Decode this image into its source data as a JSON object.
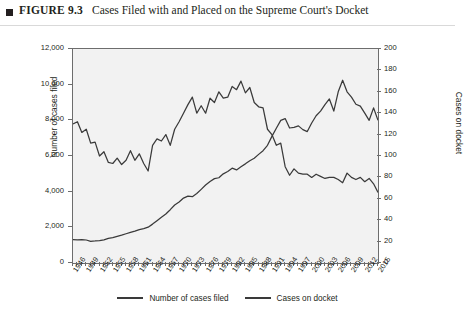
{
  "figure": {
    "label": "FIGURE 9.3",
    "caption": "Cases Filed with and Placed on the Supreme Court's Docket"
  },
  "chart_data": {
    "type": "line",
    "title": "Cases Filed with and Placed on the Supreme Court's Docket",
    "xlabel": "",
    "ylabel": "Number of cases filed",
    "y2label": "Cases on docket",
    "ylim": [
      0,
      12000
    ],
    "y2lim": [
      0,
      200
    ],
    "xlim": [
      1946,
      2015
    ],
    "grid": false,
    "legend_position": "bottom",
    "yticks": [
      "0",
      "2,000",
      "4,000",
      "6,000",
      "8,000",
      "10,000",
      "12,000"
    ],
    "ytick_values": [
      0,
      2000,
      4000,
      6000,
      8000,
      10000,
      12000
    ],
    "y2ticks": [
      "0",
      "20",
      "40",
      "60",
      "80",
      "100",
      "120",
      "140",
      "160",
      "180",
      "200"
    ],
    "y2tick_values": [
      0,
      20,
      40,
      60,
      80,
      100,
      120,
      140,
      160,
      180,
      200
    ],
    "xticks": [
      "1946",
      "1949",
      "1952",
      "1955",
      "1958",
      "1961",
      "1964",
      "1967",
      "1970",
      "1973",
      "1976",
      "1979",
      "1982",
      "1985",
      "1988",
      "1991",
      "1994",
      "1997",
      "2000",
      "2003",
      "2006",
      "2009",
      "2012",
      "2015"
    ],
    "x": [
      1946,
      1947,
      1948,
      1949,
      1950,
      1951,
      1952,
      1953,
      1954,
      1955,
      1956,
      1957,
      1958,
      1959,
      1960,
      1961,
      1962,
      1963,
      1964,
      1965,
      1966,
      1967,
      1968,
      1969,
      1970,
      1971,
      1972,
      1973,
      1974,
      1975,
      1976,
      1977,
      1978,
      1979,
      1980,
      1981,
      1982,
      1983,
      1984,
      1985,
      1986,
      1987,
      1988,
      1989,
      1990,
      1991,
      1992,
      1993,
      1994,
      1995,
      1996,
      1997,
      1998,
      1999,
      2000,
      2001,
      2002,
      2003,
      2004,
      2005,
      2006,
      2007,
      2008,
      2009,
      2010,
      2011,
      2012,
      2013,
      2014,
      2015
    ],
    "series": [
      {
        "name": "Number of cases filed",
        "axis": "left",
        "color": "#3a3a3a",
        "values": [
          1316,
          1302,
          1310,
          1290,
          1215,
          1235,
          1260,
          1302,
          1380,
          1420,
          1490,
          1560,
          1640,
          1720,
          1790,
          1870,
          1930,
          2010,
          2180,
          2370,
          2560,
          2750,
          2990,
          3250,
          3420,
          3640,
          3750,
          3720,
          3900,
          4130,
          4370,
          4570,
          4730,
          4780,
          5000,
          5130,
          5320,
          5220,
          5400,
          5560,
          5730,
          5870,
          6090,
          6300,
          6600,
          7100,
          7560,
          8000,
          8100,
          7570,
          7610,
          7690,
          7480,
          7370,
          7850,
          8260,
          8520,
          8880,
          9200,
          8520,
          9600,
          10250,
          9600,
          9300,
          8900,
          8800,
          8400,
          8000,
          8700,
          8000
        ]
      },
      {
        "name": "Cases on docket",
        "axis": "right",
        "color": "#3a3a3a",
        "values": [
          130,
          132,
          122,
          125,
          112,
          113,
          100,
          104,
          94,
          93,
          98,
          92,
          96,
          105,
          96,
          102,
          93,
          86,
          110,
          116,
          114,
          120,
          110,
          125,
          132,
          140,
          148,
          155,
          140,
          147,
          140,
          154,
          150,
          160,
          154,
          155,
          165,
          162,
          170,
          159,
          164,
          150,
          146,
          145,
          125,
          120,
          110,
          112,
          90,
          82,
          88,
          84,
          83,
          83,
          80,
          83,
          81,
          79,
          80,
          80,
          78,
          75,
          84,
          80,
          78,
          80,
          76,
          79,
          74,
          66
        ]
      }
    ]
  },
  "legend": {
    "items": [
      {
        "label": "Number of cases filed"
      },
      {
        "label": "Cases on docket"
      }
    ]
  }
}
